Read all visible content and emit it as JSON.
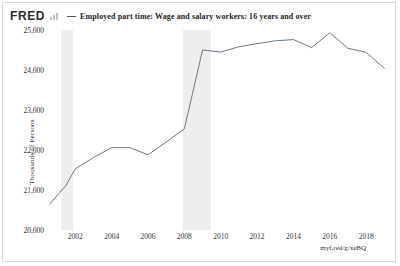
{
  "brand": {
    "logo_text": "FRED",
    "logo_icon": "bar-chart-icon"
  },
  "legend": {
    "series_label": "Employed part time: Wage and salary workers: 16 years and over",
    "marker": "line-dash"
  },
  "footer": {
    "short_url": "myf.red/g/xeBQ"
  },
  "colors": {
    "series_line": "#6b7a8a",
    "recession_band": "#ededed",
    "axis_text": "#333333",
    "frame": "#d8d8d8",
    "background": "#ffffff"
  },
  "chart_data": {
    "type": "line",
    "title": "Employed part time: Wage and salary workers: 16 years and over",
    "xlabel": "",
    "ylabel": "Thousands of Persons",
    "ylim": [
      20000,
      25000
    ],
    "xlim": [
      2000.5,
      2019.2
    ],
    "grid": false,
    "legend_position": "top",
    "ytick_labels": [
      "25,000",
      "24,000",
      "23,000",
      "22,000",
      "21,000",
      "20,000"
    ],
    "ytick_values": [
      25000,
      24000,
      23000,
      22000,
      21000,
      20000
    ],
    "xtick_labels": [
      "2002",
      "2004",
      "2006",
      "2008",
      "2010",
      "2012",
      "2014",
      "2016",
      "2018"
    ],
    "xtick_values": [
      2002,
      2004,
      2006,
      2008,
      2010,
      2012,
      2014,
      2016,
      2018
    ],
    "series": [
      {
        "name": "Employed part time: Wage and salary workers: 16 years and over",
        "color": "#6b7a8a",
        "x": [
          2000.6,
          2001.5,
          2002.0,
          2003.0,
          2004.0,
          2005.0,
          2006.0,
          2007.0,
          2008.0,
          2009.0,
          2010.0,
          2011.0,
          2012.0,
          2013.0,
          2014.0,
          2015.0,
          2016.0,
          2017.0,
          2018.0,
          2019.0
        ],
        "y": [
          20650,
          21120,
          21530,
          21810,
          22060,
          22060,
          21880,
          22200,
          22530,
          24500,
          24450,
          24580,
          24660,
          24730,
          24760,
          24560,
          24930,
          24540,
          24440,
          24040
        ]
      }
    ],
    "recession_bands": [
      {
        "label": "2001 recession",
        "start": 2001.2,
        "end": 2001.9
      },
      {
        "label": "2008-2009 recession",
        "start": 2007.95,
        "end": 2009.45
      }
    ]
  }
}
